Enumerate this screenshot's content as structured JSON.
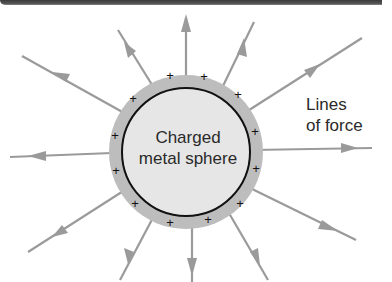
{
  "diagram": {
    "sphere_label_line1": "Charged",
    "sphere_label_line2": "metal sphere",
    "field_label_line1": "Lines",
    "field_label_line2": "of force",
    "charge_symbol": "+",
    "colors": {
      "field_line": "#9a9a9a",
      "charge_ring": "#bdbdbd",
      "sphere_fill": "#e6e6e6",
      "sphere_outline": "#111111",
      "text": "#2a2a2a"
    }
  }
}
